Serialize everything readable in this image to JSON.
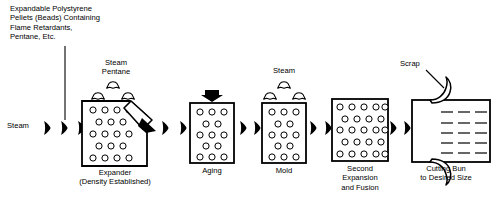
{
  "diagram": {
    "type": "process-flow",
    "orientation": "left-to-right",
    "ink_color": "#000000",
    "background_color": "#ffffff",
    "feed_label": {
      "name": "raw-material-feed",
      "lines": [
        "Expandable Polystyrene",
        "Pellets (Beads) Containing",
        "Flame Retardants,",
        "Pentane, Etc."
      ],
      "text": "Expandable Polystyrene\nPellets (Beads) Containing\nFlame Retardants,\nPentane, Etc."
    },
    "inlet_label": {
      "name": "steam-inlet",
      "text": "Steam"
    },
    "emissions": [
      {
        "name": "expander-vent",
        "lines": [
          "Steam",
          "Pentane"
        ],
        "text": "Steam\nPentane",
        "puff_count": 3
      },
      {
        "name": "mold-vent",
        "lines": [
          "Steam"
        ],
        "text": "Steam",
        "puff_count": 3
      }
    ],
    "stages": [
      {
        "id": "expander",
        "caption_lines": [
          "Expander",
          "(Density Established)"
        ],
        "caption": "Expander\n(Density Established)",
        "bead_rows": [
          4,
          3,
          4,
          3,
          4
        ],
        "shape": "clipped-corner-vessel",
        "has_discharge_chute": true
      },
      {
        "id": "aging",
        "caption_lines": [
          "Aging"
        ],
        "caption": "Aging",
        "bead_rows": [
          3,
          2,
          3,
          2,
          3
        ],
        "shape": "rectangle",
        "has_top_arrow": true
      },
      {
        "id": "mold",
        "caption_lines": [
          "Mold"
        ],
        "caption": "Mold",
        "bead_rows": [
          3,
          2,
          3,
          2,
          3
        ],
        "shape": "rectangle"
      },
      {
        "id": "second-expansion",
        "caption_lines": [
          "Second",
          "Expansion",
          "and Fusion"
        ],
        "caption": "Second\nExpansion\nand Fusion",
        "bead_rows": [
          5,
          4,
          5,
          4,
          5
        ],
        "shape": "rectangle"
      },
      {
        "id": "cutting",
        "caption_lines": [
          "Cutting Bun",
          "to Desired Size"
        ],
        "caption": "Cutting Bun\nto Desired Size",
        "shape": "bun-block",
        "cut_line_rows": 5,
        "cut_dashes_per_row": 3
      }
    ],
    "scrap_label": {
      "name": "scrap-callout",
      "text": "Scrap",
      "leader": "diagonal-down-right"
    },
    "flow_arrow_count": 9
  }
}
